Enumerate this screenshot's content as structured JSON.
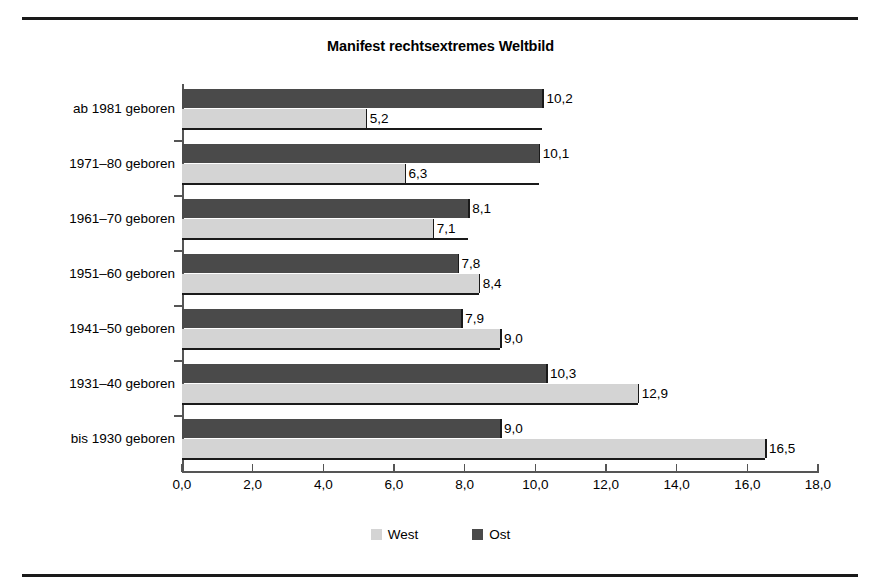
{
  "chart_data": {
    "type": "bar",
    "orientation": "horizontal",
    "title": "Manifest rechtsextremes Weltbild",
    "xlabel": "",
    "ylabel": "",
    "xlim": [
      0.0,
      18.0
    ],
    "xticks": [
      "0,0",
      "2,0",
      "4,0",
      "6,0",
      "8,0",
      "10,0",
      "12,0",
      "14,0",
      "16,0",
      "18,0"
    ],
    "xtick_values": [
      0,
      2,
      4,
      6,
      8,
      10,
      12,
      14,
      16,
      18
    ],
    "grid": false,
    "legend_position": "bottom",
    "categories": [
      "ab 1981 geboren",
      "1971–80 geboren",
      "1961–70 geboren",
      "1951–60 geboren",
      "1941–50 geboren",
      "1931–40 geboren",
      "bis 1930 geboren"
    ],
    "series": [
      {
        "name": "Ost",
        "color": "#4a4a4a",
        "values": [
          10.2,
          10.1,
          8.1,
          7.8,
          7.9,
          10.3,
          9.0
        ],
        "labels": [
          "10,2",
          "10,1",
          "8,1",
          "7,8",
          "7,9",
          "10,3",
          "9,0"
        ]
      },
      {
        "name": "West",
        "color": "#d4d4d4",
        "values": [
          5.2,
          6.3,
          7.1,
          8.4,
          9.0,
          12.9,
          16.5
        ],
        "labels": [
          "5,2",
          "6,3",
          "7,1",
          "8,4",
          "9,0",
          "12,9",
          "16,5"
        ]
      }
    ]
  },
  "legend": {
    "items": [
      {
        "label": "West",
        "color": "#d4d4d4"
      },
      {
        "label": "Ost",
        "color": "#4a4a4a"
      }
    ]
  }
}
